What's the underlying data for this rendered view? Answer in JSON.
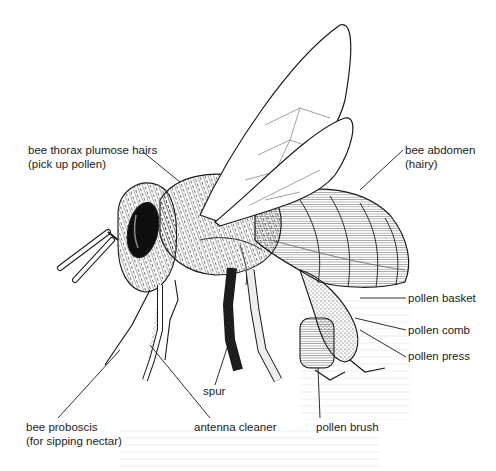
{
  "diagram": {
    "labels": [
      {
        "id": "thorax-hairs",
        "line1": "bee thorax plumose hairs",
        "line2": "(pick up pollen)",
        "x": 28,
        "y": 143
      },
      {
        "id": "abdomen",
        "line1": "bee abdomen",
        "line2": "(hairy)",
        "x": 405,
        "y": 143
      },
      {
        "id": "pollen-basket",
        "line1": "pollen basket",
        "line2": "",
        "x": 408,
        "y": 292
      },
      {
        "id": "pollen-comb",
        "line1": "pollen comb",
        "line2": "",
        "x": 408,
        "y": 324
      },
      {
        "id": "pollen-press",
        "line1": "pollen press",
        "line2": "",
        "x": 408,
        "y": 350
      },
      {
        "id": "spur",
        "line1": "spur",
        "line2": "",
        "x": 203,
        "y": 385
      },
      {
        "id": "bee-proboscis",
        "line1": "bee proboscis",
        "line2": "(for sipping nectar)",
        "x": 26,
        "y": 420
      },
      {
        "id": "antenna-cleaner",
        "line1": "antenna cleaner",
        "line2": "",
        "x": 194,
        "y": 420
      },
      {
        "id": "pollen-brush",
        "line1": "pollen brush",
        "line2": "",
        "x": 316,
        "y": 420
      }
    ],
    "colors": {
      "ink": "#1a1a1a",
      "paper": "#ffffff",
      "eye": "#0e0e0e",
      "wing_vein": "#8a8a8a"
    }
  }
}
